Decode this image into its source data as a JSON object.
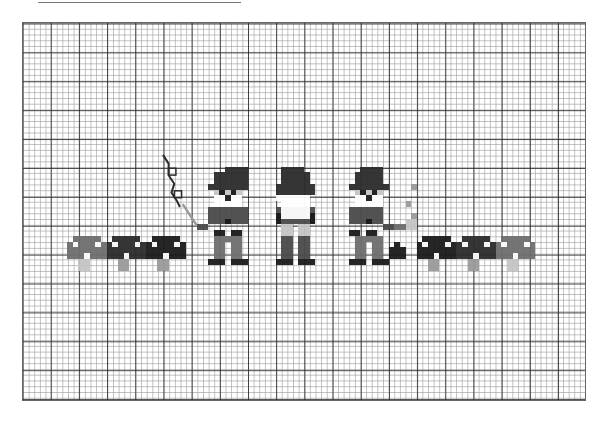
{
  "pattern": {
    "title_rule": true,
    "grid": {
      "cols": 100,
      "rows": 66,
      "cell_w": 5.64,
      "cell_h": 5.78,
      "major_every": 5
    },
    "colors": {
      "black": "#1a1a1a",
      "dark": "#2b2b2b",
      "mid": "#4a4a4a",
      "gray": "#6e6e6e",
      "light": "#9a9a9a",
      "pale": "#c4c4c4",
      "white": "#ffffff"
    },
    "sprites": [
      {
        "name": "mushroom-1",
        "rects": [
          {
            "c": 9,
            "r": 37,
            "w": 5,
            "h": 1,
            "k": "gray"
          },
          {
            "c": 8,
            "r": 38,
            "w": 7,
            "h": 3,
            "k": "gray"
          },
          {
            "c": 9,
            "r": 38,
            "w": 1,
            "h": 1,
            "k": "white"
          },
          {
            "c": 13,
            "r": 38,
            "w": 1,
            "h": 1,
            "k": "white"
          },
          {
            "c": 11,
            "r": 40,
            "w": 1,
            "h": 1,
            "k": "white"
          },
          {
            "c": 10,
            "r": 41,
            "w": 2,
            "h": 2,
            "k": "pale"
          }
        ]
      },
      {
        "name": "mushroom-2",
        "rects": [
          {
            "c": 16,
            "r": 37,
            "w": 5,
            "h": 1,
            "k": "dark"
          },
          {
            "c": 15,
            "r": 38,
            "w": 7,
            "h": 3,
            "k": "dark"
          },
          {
            "c": 16,
            "r": 38,
            "w": 1,
            "h": 1,
            "k": "white"
          },
          {
            "c": 20,
            "r": 38,
            "w": 1,
            "h": 1,
            "k": "white"
          },
          {
            "c": 18,
            "r": 40,
            "w": 1,
            "h": 1,
            "k": "white"
          },
          {
            "c": 17,
            "r": 41,
            "w": 2,
            "h": 2,
            "k": "light"
          }
        ]
      },
      {
        "name": "mushroom-3",
        "rects": [
          {
            "c": 23,
            "r": 37,
            "w": 5,
            "h": 1,
            "k": "black"
          },
          {
            "c": 22,
            "r": 38,
            "w": 7,
            "h": 3,
            "k": "black"
          },
          {
            "c": 23,
            "r": 38,
            "w": 1,
            "h": 1,
            "k": "white"
          },
          {
            "c": 27,
            "r": 38,
            "w": 1,
            "h": 1,
            "k": "white"
          },
          {
            "c": 25,
            "r": 40,
            "w": 1,
            "h": 1,
            "k": "white"
          },
          {
            "c": 24,
            "r": 41,
            "w": 2,
            "h": 2,
            "k": "light"
          }
        ]
      },
      {
        "name": "gnome-1",
        "rects": [
          {
            "c": 36,
            "r": 25,
            "w": 4,
            "h": 1,
            "k": "dark"
          },
          {
            "c": 34,
            "r": 26,
            "w": 6,
            "h": 2,
            "k": "dark"
          },
          {
            "c": 33,
            "r": 28,
            "w": 7,
            "h": 1,
            "k": "dark"
          },
          {
            "c": 34,
            "r": 29,
            "w": 5,
            "h": 1,
            "k": "pale"
          },
          {
            "c": 35,
            "r": 29,
            "w": 1,
            "h": 1,
            "k": "black"
          },
          {
            "c": 37,
            "r": 29,
            "w": 1,
            "h": 1,
            "k": "black"
          },
          {
            "c": 34,
            "r": 30,
            "w": 5,
            "h": 1,
            "k": "white"
          },
          {
            "c": 36,
            "r": 30,
            "w": 1,
            "h": 1,
            "k": "black"
          },
          {
            "c": 34,
            "r": 31,
            "w": 5,
            "h": 1,
            "k": "white"
          },
          {
            "c": 33,
            "r": 32,
            "w": 1,
            "h": 3,
            "k": "mid"
          },
          {
            "c": 39,
            "r": 32,
            "w": 1,
            "h": 3,
            "k": "mid"
          },
          {
            "c": 34,
            "r": 32,
            "w": 5,
            "h": 3,
            "k": "mid"
          },
          {
            "c": 36,
            "r": 34,
            "w": 1,
            "h": 1,
            "k": "black"
          },
          {
            "c": 31,
            "r": 35,
            "w": 2,
            "h": 1,
            "k": "mid"
          },
          {
            "c": 34,
            "r": 36,
            "w": 2,
            "h": 1,
            "k": "black"
          },
          {
            "c": 37,
            "r": 36,
            "w": 2,
            "h": 1,
            "k": "black"
          },
          {
            "c": 34,
            "r": 37,
            "w": 5,
            "h": 1,
            "k": "gray"
          },
          {
            "c": 34,
            "r": 38,
            "w": 2,
            "h": 3,
            "k": "gray"
          },
          {
            "c": 37,
            "r": 38,
            "w": 2,
            "h": 3,
            "k": "gray"
          },
          {
            "c": 33,
            "r": 41,
            "w": 3,
            "h": 1,
            "k": "black"
          },
          {
            "c": 37,
            "r": 41,
            "w": 3,
            "h": 1,
            "k": "black"
          }
        ]
      },
      {
        "name": "gnome-2",
        "rects": [
          {
            "c": 46,
            "r": 25,
            "w": 4,
            "h": 1,
            "k": "dark"
          },
          {
            "c": 46,
            "r": 26,
            "w": 5,
            "h": 2,
            "k": "dark"
          },
          {
            "c": 45,
            "r": 28,
            "w": 7,
            "h": 2,
            "k": "dark"
          },
          {
            "c": 45,
            "r": 30,
            "w": 1,
            "h": 1,
            "k": "white"
          },
          {
            "c": 46,
            "r": 30,
            "w": 5,
            "h": 2,
            "k": "white"
          },
          {
            "c": 45,
            "r": 32,
            "w": 7,
            "h": 3,
            "k": "mid"
          },
          {
            "c": 46,
            "r": 32,
            "w": 5,
            "h": 2,
            "k": "white"
          },
          {
            "c": 45,
            "r": 33,
            "w": 1,
            "h": 2,
            "k": "black"
          },
          {
            "c": 51,
            "r": 33,
            "w": 1,
            "h": 2,
            "k": "black"
          },
          {
            "c": 46,
            "r": 35,
            "w": 2,
            "h": 2,
            "k": "pale"
          },
          {
            "c": 49,
            "r": 35,
            "w": 2,
            "h": 2,
            "k": "pale"
          },
          {
            "c": 46,
            "r": 37,
            "w": 2,
            "h": 4,
            "k": "mid"
          },
          {
            "c": 49,
            "r": 37,
            "w": 2,
            "h": 4,
            "k": "mid"
          },
          {
            "c": 45,
            "r": 41,
            "w": 3,
            "h": 1,
            "k": "black"
          },
          {
            "c": 49,
            "r": 41,
            "w": 3,
            "h": 1,
            "k": "black"
          }
        ]
      },
      {
        "name": "gnome-3",
        "rects": [
          {
            "c": 60,
            "r": 25,
            "w": 4,
            "h": 1,
            "k": "dark"
          },
          {
            "c": 59,
            "r": 26,
            "w": 5,
            "h": 2,
            "k": "dark"
          },
          {
            "c": 58,
            "r": 28,
            "w": 7,
            "h": 1,
            "k": "dark"
          },
          {
            "c": 59,
            "r": 29,
            "w": 5,
            "h": 1,
            "k": "pale"
          },
          {
            "c": 60,
            "r": 29,
            "w": 1,
            "h": 1,
            "k": "black"
          },
          {
            "c": 62,
            "r": 29,
            "w": 1,
            "h": 1,
            "k": "black"
          },
          {
            "c": 59,
            "r": 30,
            "w": 5,
            "h": 1,
            "k": "white"
          },
          {
            "c": 61,
            "r": 30,
            "w": 1,
            "h": 1,
            "k": "black"
          },
          {
            "c": 59,
            "r": 31,
            "w": 5,
            "h": 1,
            "k": "white"
          },
          {
            "c": 58,
            "r": 32,
            "w": 6,
            "h": 3,
            "k": "mid"
          },
          {
            "c": 61,
            "r": 34,
            "w": 1,
            "h": 1,
            "k": "black"
          },
          {
            "c": 64,
            "r": 35,
            "w": 2,
            "h": 1,
            "k": "mid"
          },
          {
            "c": 58,
            "r": 36,
            "w": 2,
            "h": 1,
            "k": "black"
          },
          {
            "c": 61,
            "r": 36,
            "w": 2,
            "h": 1,
            "k": "black"
          },
          {
            "c": 59,
            "r": 37,
            "w": 5,
            "h": 1,
            "k": "gray"
          },
          {
            "c": 59,
            "r": 38,
            "w": 2,
            "h": 3,
            "k": "gray"
          },
          {
            "c": 62,
            "r": 38,
            "w": 2,
            "h": 3,
            "k": "gray"
          },
          {
            "c": 58,
            "r": 41,
            "w": 3,
            "h": 1,
            "k": "black"
          },
          {
            "c": 62,
            "r": 41,
            "w": 3,
            "h": 1,
            "k": "black"
          },
          {
            "c": 69,
            "r": 28,
            "w": 1,
            "h": 1,
            "k": "light"
          },
          {
            "c": 68,
            "r": 31,
            "w": 1,
            "h": 1,
            "k": "light"
          },
          {
            "c": 69,
            "r": 33,
            "w": 1,
            "h": 1,
            "k": "light"
          },
          {
            "c": 66,
            "r": 35,
            "w": 2,
            "h": 1,
            "k": "gray"
          },
          {
            "c": 68,
            "r": 34,
            "w": 2,
            "h": 2,
            "k": "pale"
          },
          {
            "c": 66,
            "r": 38,
            "w": 1,
            "h": 1,
            "k": "black"
          },
          {
            "c": 65,
            "r": 39,
            "w": 3,
            "h": 2,
            "k": "black"
          }
        ]
      },
      {
        "name": "mushroom-4",
        "rects": [
          {
            "c": 71,
            "r": 37,
            "w": 5,
            "h": 1,
            "k": "black"
          },
          {
            "c": 70,
            "r": 38,
            "w": 7,
            "h": 3,
            "k": "black"
          },
          {
            "c": 71,
            "r": 38,
            "w": 1,
            "h": 1,
            "k": "white"
          },
          {
            "c": 75,
            "r": 38,
            "w": 1,
            "h": 1,
            "k": "white"
          },
          {
            "c": 73,
            "r": 40,
            "w": 1,
            "h": 1,
            "k": "white"
          },
          {
            "c": 72,
            "r": 41,
            "w": 2,
            "h": 2,
            "k": "light"
          }
        ]
      },
      {
        "name": "mushroom-5",
        "rects": [
          {
            "c": 78,
            "r": 37,
            "w": 5,
            "h": 1,
            "k": "dark"
          },
          {
            "c": 77,
            "r": 38,
            "w": 7,
            "h": 3,
            "k": "dark"
          },
          {
            "c": 78,
            "r": 38,
            "w": 1,
            "h": 1,
            "k": "white"
          },
          {
            "c": 82,
            "r": 38,
            "w": 1,
            "h": 1,
            "k": "white"
          },
          {
            "c": 80,
            "r": 40,
            "w": 1,
            "h": 1,
            "k": "white"
          },
          {
            "c": 79,
            "r": 41,
            "w": 2,
            "h": 2,
            "k": "light"
          }
        ]
      },
      {
        "name": "mushroom-6",
        "rects": [
          {
            "c": 85,
            "r": 37,
            "w": 5,
            "h": 1,
            "k": "gray"
          },
          {
            "c": 84,
            "r": 38,
            "w": 7,
            "h": 3,
            "k": "gray"
          },
          {
            "c": 85,
            "r": 38,
            "w": 1,
            "h": 1,
            "k": "white"
          },
          {
            "c": 89,
            "r": 38,
            "w": 1,
            "h": 1,
            "k": "white"
          },
          {
            "c": 87,
            "r": 40,
            "w": 1,
            "h": 1,
            "k": "white"
          },
          {
            "c": 86,
            "r": 41,
            "w": 2,
            "h": 2,
            "k": "pale"
          }
        ]
      }
    ],
    "backstitch": {
      "balloon_string": [
        [
          25,
          23
        ],
        [
          26,
          24.5
        ],
        [
          26,
          26.5
        ],
        [
          27,
          28
        ],
        [
          26.5,
          29.5
        ],
        [
          27.5,
          31
        ],
        [
          28,
          32
        ]
      ],
      "wand": [
        [
          28.5,
          31.5
        ],
        [
          31,
          35.2
        ]
      ]
    }
  }
}
